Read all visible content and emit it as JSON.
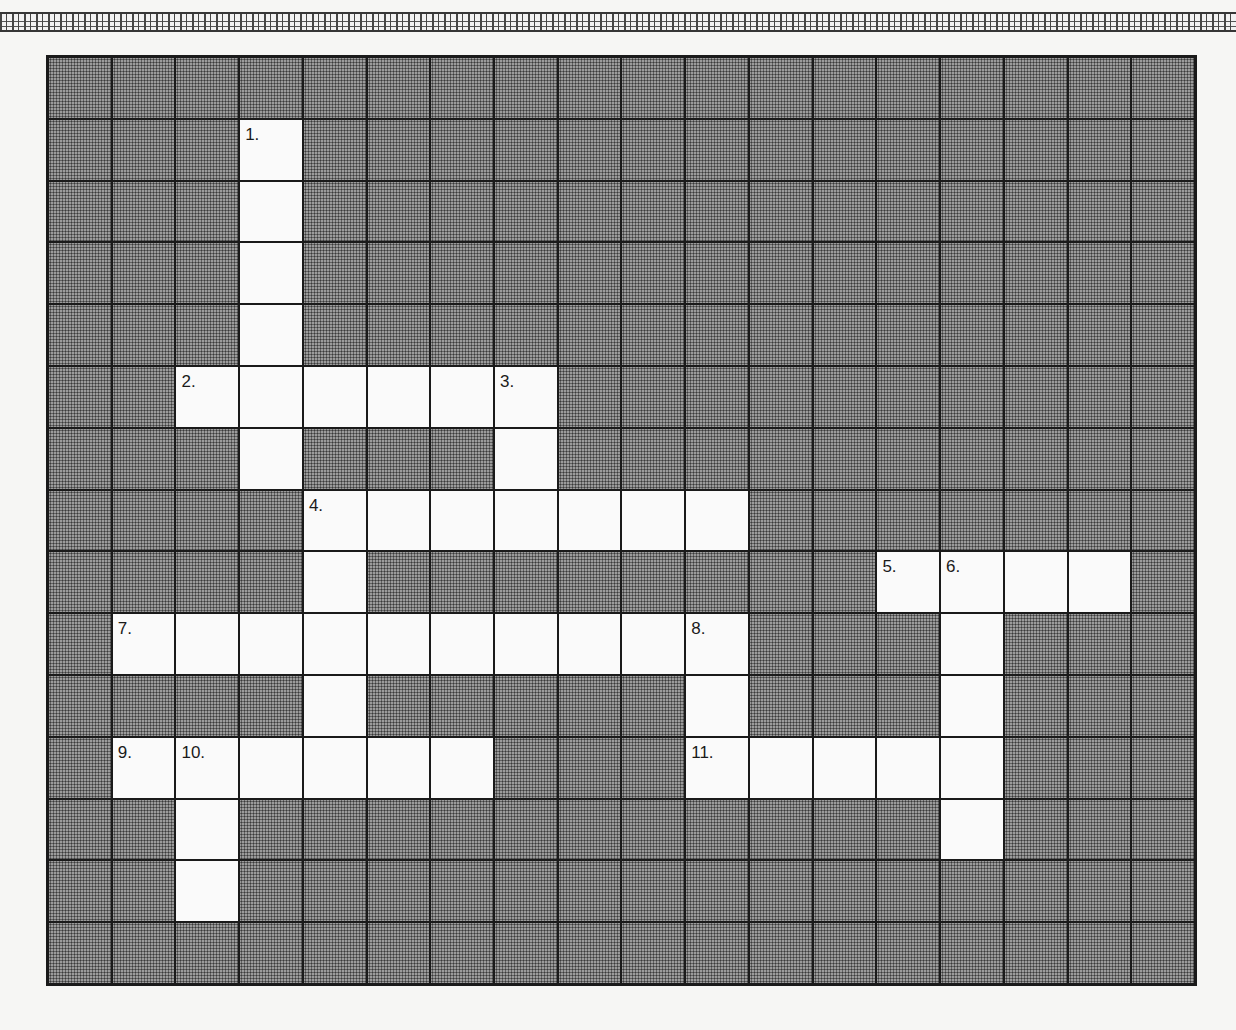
{
  "puzzle": {
    "type": "crossword",
    "columns": 18,
    "rows": 15,
    "open_cells": [
      [
        1,
        3
      ],
      [
        2,
        3
      ],
      [
        3,
        3
      ],
      [
        4,
        3
      ],
      [
        5,
        2
      ],
      [
        5,
        3
      ],
      [
        5,
        4
      ],
      [
        5,
        5
      ],
      [
        5,
        6
      ],
      [
        5,
        7
      ],
      [
        6,
        3
      ],
      [
        6,
        7
      ],
      [
        7,
        4
      ],
      [
        7,
        5
      ],
      [
        7,
        6
      ],
      [
        7,
        7
      ],
      [
        7,
        8
      ],
      [
        7,
        9
      ],
      [
        7,
        10
      ],
      [
        8,
        4
      ],
      [
        8,
        13
      ],
      [
        8,
        14
      ],
      [
        8,
        15
      ],
      [
        8,
        16
      ],
      [
        9,
        1
      ],
      [
        9,
        2
      ],
      [
        9,
        3
      ],
      [
        9,
        4
      ],
      [
        9,
        5
      ],
      [
        9,
        6
      ],
      [
        9,
        7
      ],
      [
        9,
        8
      ],
      [
        9,
        9
      ],
      [
        9,
        10
      ],
      [
        9,
        14
      ],
      [
        10,
        4
      ],
      [
        10,
        10
      ],
      [
        10,
        14
      ],
      [
        11,
        1
      ],
      [
        11,
        2
      ],
      [
        11,
        3
      ],
      [
        11,
        4
      ],
      [
        11,
        5
      ],
      [
        11,
        6
      ],
      [
        11,
        10
      ],
      [
        11,
        11
      ],
      [
        11,
        12
      ],
      [
        11,
        13
      ],
      [
        11,
        14
      ],
      [
        12,
        2
      ],
      [
        12,
        14
      ],
      [
        13,
        2
      ]
    ],
    "clue_numbers": [
      {
        "row": 1,
        "col": 3,
        "label": "1."
      },
      {
        "row": 5,
        "col": 2,
        "label": "2."
      },
      {
        "row": 5,
        "col": 7,
        "label": "3."
      },
      {
        "row": 7,
        "col": 4,
        "label": "4."
      },
      {
        "row": 8,
        "col": 13,
        "label": "5."
      },
      {
        "row": 8,
        "col": 14,
        "label": "6."
      },
      {
        "row": 9,
        "col": 1,
        "label": "7."
      },
      {
        "row": 9,
        "col": 10,
        "label": "8."
      },
      {
        "row": 11,
        "col": 1,
        "label": "9."
      },
      {
        "row": 11,
        "col": 2,
        "label": "10."
      },
      {
        "row": 11,
        "col": 10,
        "label": "11."
      }
    ]
  },
  "colors": {
    "grid_line": "#1a1a1a",
    "blocked_cell": "#8a8a8a",
    "open_cell": "#fafafa",
    "page_background": "#f6f6f4"
  }
}
